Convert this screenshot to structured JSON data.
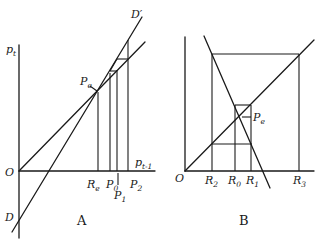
{
  "figure": {
    "panels": [
      {
        "id": "A",
        "label": "A",
        "y_axis_label": {
          "base": "p",
          "sub": "t"
        },
        "x_axis_label": {
          "base": "p",
          "sub": "t-1"
        },
        "origin_label": "O",
        "intercept_label": "D",
        "demand_curve_label": "D′",
        "equilibrium_label": {
          "base": "P",
          "sub": "e"
        },
        "x_ticks": [
          {
            "base": "R",
            "sub": "e"
          },
          {
            "base": "P",
            "sub": "0"
          },
          {
            "base": "P",
            "sub": "1"
          },
          {
            "base": "P",
            "sub": "2"
          }
        ]
      },
      {
        "id": "B",
        "label": "B",
        "origin_label": "O",
        "equilibrium_label": {
          "base": "P",
          "sub": "e"
        },
        "x_ticks": [
          {
            "base": "R",
            "sub": "2"
          },
          {
            "base": "R",
            "sub": "0"
          },
          {
            "base": "R",
            "sub": "1"
          },
          {
            "base": "R",
            "sub": "3"
          }
        ]
      }
    ]
  }
}
